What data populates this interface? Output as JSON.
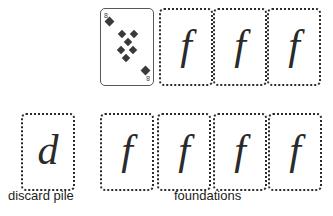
{
  "canvas": {
    "width": 333,
    "height": 216,
    "background": "#ffffff"
  },
  "colors": {
    "ink": "#2a2a2a",
    "card_border_solid": "#55585c",
    "card_border_empty": "#2b2b2b",
    "pip": "#3a3a3a",
    "caption": "#1d1d1d",
    "card_face": "#ffffff"
  },
  "rows": [
    {
      "name": "top-row",
      "y": 8,
      "cards": [
        {
          "kind": "face-up-card",
          "rank": "8",
          "suit": "diamonds",
          "suit_symbol": "♦",
          "index_top_left": "8",
          "index_bottom_right": "8",
          "pip_count": 8,
          "x": 100,
          "border": "solid"
        },
        {
          "kind": "foundation-slot",
          "letter": "f",
          "x": 159,
          "border": "dotted"
        },
        {
          "kind": "foundation-slot",
          "letter": "f",
          "x": 213,
          "border": "dotted"
        },
        {
          "kind": "foundation-slot",
          "letter": "f",
          "x": 267,
          "border": "dotted"
        }
      ]
    },
    {
      "name": "bottom-row",
      "y": 113,
      "cards": [
        {
          "kind": "discard-slot",
          "letter": "d",
          "x": 21,
          "border": "dotted"
        },
        {
          "kind": "foundation-slot",
          "letter": "f",
          "x": 100,
          "border": "dotted"
        },
        {
          "kind": "foundation-slot",
          "letter": "f",
          "x": 157,
          "border": "dotted"
        },
        {
          "kind": "foundation-slot",
          "letter": "f",
          "x": 213,
          "border": "dotted"
        },
        {
          "kind": "foundation-slot",
          "letter": "f",
          "x": 268,
          "border": "dotted"
        }
      ]
    }
  ],
  "labels": {
    "discard_pile": "discard pile",
    "foundations": "foundations"
  },
  "pip_layout": [
    {
      "x": 5,
      "y": 9,
      "size": "big"
    },
    {
      "x": 18,
      "y": 22,
      "size": "small"
    },
    {
      "x": 30,
      "y": 22,
      "size": "small"
    },
    {
      "x": 24,
      "y": 30,
      "size": "small"
    },
    {
      "x": 17,
      "y": 38,
      "size": "small"
    },
    {
      "x": 29,
      "y": 38,
      "size": "small"
    },
    {
      "x": 22,
      "y": 46,
      "size": "small"
    },
    {
      "x": 41,
      "y": 58,
      "size": "big"
    }
  ]
}
